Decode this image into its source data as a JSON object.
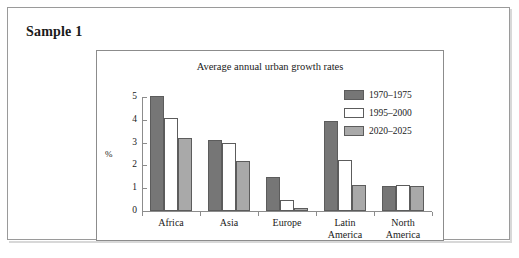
{
  "sample": {
    "label": "Sample 1"
  },
  "chart_data": {
    "type": "bar",
    "title": "Average annual urban growth rates",
    "xlabel": "",
    "ylabel": "%",
    "ylim": [
      0,
      5
    ],
    "ytick_labels": [
      "0",
      "1",
      "2",
      "3",
      "4",
      "5"
    ],
    "grid": false,
    "legend_position": "top-right",
    "categories": [
      "Africa",
      "Asia",
      "Europe",
      "Latin\nAmerica",
      "North\nAmerica"
    ],
    "series": [
      {
        "name": "1970–1975",
        "color": "#767676",
        "values": [
          5.05,
          3.1,
          1.5,
          3.95,
          1.1
        ]
      },
      {
        "name": "1995–2000",
        "color": "#ffffff",
        "values": [
          4.1,
          3.0,
          0.5,
          2.25,
          1.15
        ]
      },
      {
        "name": "2020–2025",
        "color": "#a9a9a9",
        "values": [
          3.2,
          2.2,
          0.15,
          1.15,
          1.1
        ]
      }
    ]
  }
}
